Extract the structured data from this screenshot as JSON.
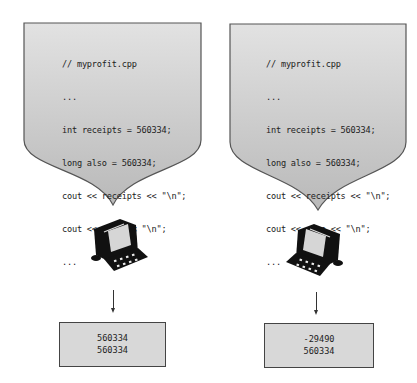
{
  "panels": [
    {
      "code_lines": [
        "// myprofit.cpp",
        "...",
        "int receipts = 560334;",
        "long also = 560334;",
        "cout << receipts << \"\\n\";",
        "cout << also << \"\\n\";",
        "..."
      ],
      "output_lines": [
        "560334",
        "560334"
      ]
    },
    {
      "code_lines": [
        "// myprofit.cpp",
        "...",
        "int receipts = 560334;",
        "long also = 560334;",
        "cout << receipts << \"\\n\";",
        "cout << also << \"\\n\";",
        "..."
      ],
      "output_lines": [
        "-29490",
        "560334"
      ]
    }
  ],
  "icons": {
    "computer": "computer-icon",
    "arrow": "arrow-down-icon"
  },
  "colors": {
    "bubble_fill": "#c8c8c8",
    "bubble_stroke": "#555555",
    "output_fill": "#d8d8d8",
    "computer": "#111111"
  }
}
